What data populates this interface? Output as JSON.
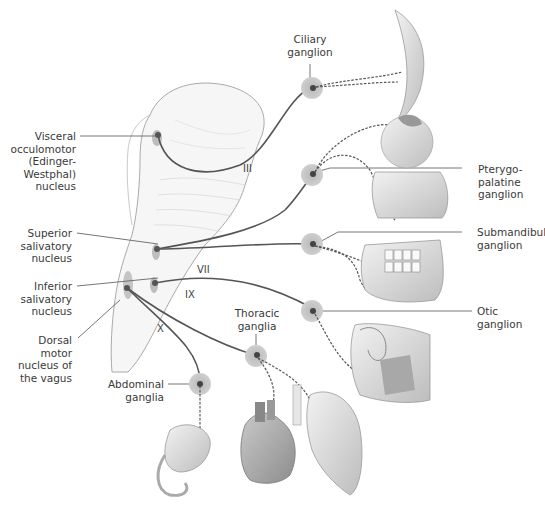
{
  "figure": {
    "colors": {
      "nerve_line": "#555555",
      "ganglion_halo": "#c8c8c8",
      "nucleus": "#555555",
      "brainstem_outline": "#9a9a9a",
      "organ_fill": "#e2e2e2"
    }
  },
  "nuclei_labels": {
    "visceral_oculomotor": [
      "Visceral",
      "occulomotor",
      "(Edinger-",
      "Westphal)",
      "nucleus"
    ],
    "superior_salivatory": [
      "Superior",
      "salivatory",
      "nucleus"
    ],
    "inferior_salivatory": [
      "Inferior",
      "salivatory",
      "nucleus"
    ],
    "dorsal_vagus": [
      "Dorsal",
      "motor",
      "nucleus of",
      "the vagus"
    ]
  },
  "ganglia_labels": {
    "ciliary": [
      "Ciliary",
      "ganglion"
    ],
    "pterygopalatine": [
      "Pterygo-",
      "palatine",
      "ganglion"
    ],
    "submandibular": [
      "Submandibular",
      "ganglion"
    ],
    "otic": [
      "Otic",
      "ganglion"
    ],
    "thoracic": [
      "Thoracic",
      "ganglia"
    ],
    "abdominal": [
      "Abdominal",
      "ganglia"
    ]
  },
  "cranial_nerves": {
    "III": "III",
    "VII": "VII",
    "IX": "IX",
    "X": "X"
  },
  "target_organs": [
    "eye-iris-ciliary",
    "eyeball-lacrimal",
    "nasal-cavity",
    "jaw-salivary-glands",
    "ear-parotid",
    "lung",
    "heart",
    "stomach"
  ]
}
